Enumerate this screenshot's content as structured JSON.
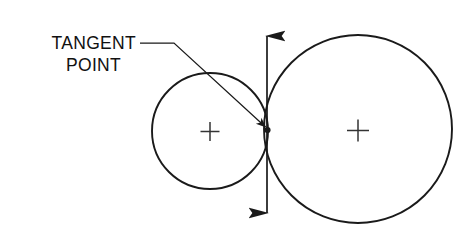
{
  "diagram": {
    "background_color": "#ffffff",
    "line_color": "#1a1a1a",
    "callout": {
      "line1": "TANGENT",
      "line2": "POINT",
      "text_anchor_x": 136,
      "line1_y": 49,
      "line2_y": 71,
      "leader": {
        "name": "leader-line",
        "horizontal_start_x": 140,
        "horizontal_end_x": 174,
        "horizontal_y": 43,
        "arrow_tip_x": 268,
        "arrow_tip_y": 128
      }
    },
    "circles": [
      {
        "name": "left-circle",
        "cx": 210,
        "cy": 131,
        "r": 58,
        "center_mark": "plus",
        "center_mark_size": 19
      },
      {
        "name": "right-circle",
        "cx": 358,
        "cy": 129,
        "r": 94,
        "center_mark": "plus",
        "center_mark_size": 22
      }
    ],
    "tangent_point": {
      "name": "tangent-point",
      "x": 268,
      "y": 130
    },
    "tangent_line": {
      "name": "tangent-axis-arrow",
      "x": 267,
      "top_y": 33,
      "bottom_y": 216,
      "arrowheads": "both",
      "orientation": "vertical"
    }
  }
}
